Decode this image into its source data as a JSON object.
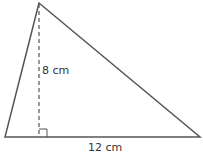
{
  "diagram": {
    "shape": "triangle",
    "height_label": "8 cm",
    "base_label": "12 cm",
    "stroke_color": "#555555",
    "vertices": {
      "apex": [
        39,
        3
      ],
      "bottom_left": [
        5,
        137
      ],
      "bottom_right": [
        200,
        137
      ]
    }
  }
}
